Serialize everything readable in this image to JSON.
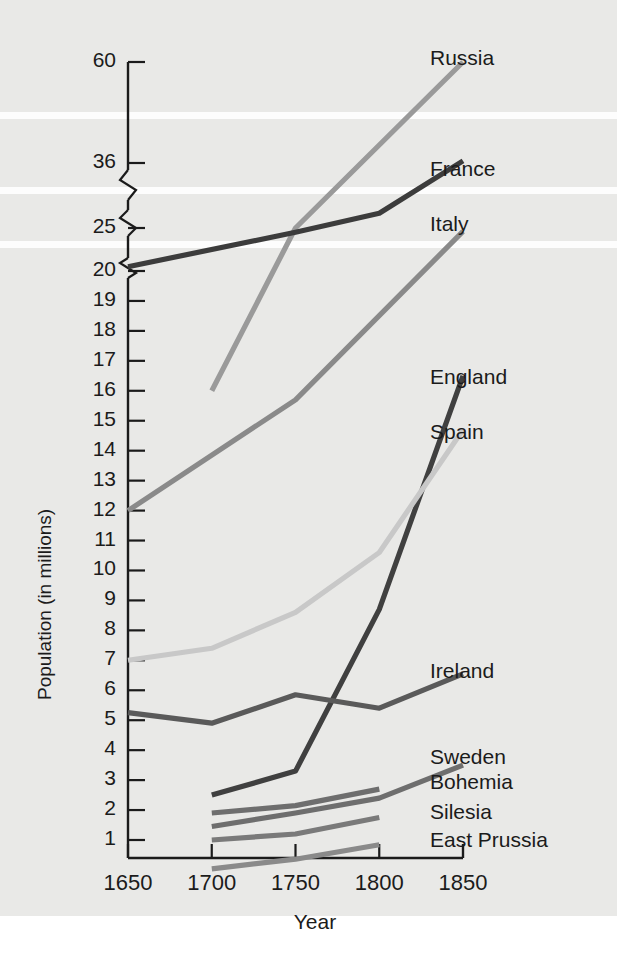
{
  "chart_data": {
    "type": "line",
    "title": "",
    "xlabel": "Year",
    "ylabel": "Population (in millions)",
    "x": [
      1650,
      1700,
      1750,
      1800,
      1850
    ],
    "xticks": [
      "1650",
      "1700",
      "1750",
      "1800",
      "1850"
    ],
    "yticks": [
      "60",
      "36",
      "25",
      "20",
      "19",
      "18",
      "17",
      "16",
      "15",
      "14",
      "13",
      "12",
      "11",
      "10",
      "9",
      "8",
      "7",
      "6",
      "5",
      "4",
      "3",
      "2",
      "1"
    ],
    "axis_breaks": [
      {
        "between": "20 and 25"
      },
      {
        "between": "25 and 36"
      },
      {
        "between": "36 and 60"
      }
    ],
    "grid": false,
    "legend_position": "right-inline-labels",
    "series": [
      {
        "name": "Russia",
        "color": "#9a9a9a",
        "x": [
          1700,
          1750,
          1850
        ],
        "values": [
          16.0,
          25.0,
          60.0
        ]
      },
      {
        "name": "France",
        "color": "#3c3c3c",
        "x": [
          1650,
          1750,
          1800,
          1850
        ],
        "values": [
          20.5,
          24.5,
          27.5,
          36.5
        ]
      },
      {
        "name": "Italy",
        "color": "#8a8a8a",
        "x": [
          1650,
          1750,
          1850
        ],
        "values": [
          12.0,
          15.7,
          24.6
        ]
      },
      {
        "name": "England",
        "color": "#404040",
        "x": [
          1700,
          1750,
          1800,
          1850
        ],
        "values": [
          2.5,
          3.3,
          8.7,
          16.5
        ]
      },
      {
        "name": "Spain",
        "color": "#c8c8c8",
        "x": [
          1650,
          1700,
          1750,
          1800,
          1850
        ],
        "values": [
          7.0,
          7.4,
          8.6,
          10.6,
          14.7
        ]
      },
      {
        "name": "Ireland",
        "color": "#5a5a5a",
        "x": [
          1650,
          1700,
          1750,
          1800,
          1850
        ],
        "values": [
          5.25,
          4.9,
          5.85,
          5.4,
          6.55
        ]
      },
      {
        "name": "Sweden",
        "color": "#6e6e6e",
        "x": [
          1700,
          1750,
          1800,
          1850
        ],
        "values": [
          1.45,
          1.9,
          2.4,
          3.5
        ]
      },
      {
        "name": "Bohemia",
        "color": "#6e6e6e",
        "x": [
          1700,
          1750,
          1800
        ],
        "values": [
          1.9,
          2.15,
          2.7
        ]
      },
      {
        "name": "Silesia",
        "color": "#7a7a7a",
        "x": [
          1700,
          1750,
          1800
        ],
        "values": [
          1.0,
          1.2,
          1.75
        ]
      },
      {
        "name": "East Prussia",
        "color": "#8a8a8a",
        "x": [
          1700,
          1750,
          1800
        ],
        "values": [
          0.4,
          0.6,
          0.9
        ]
      }
    ],
    "series_labels": [
      {
        "name": "Russia",
        "top": 46,
        "left": 430
      },
      {
        "name": "France",
        "top": 157,
        "left": 430
      },
      {
        "name": "Italy",
        "top": 212,
        "left": 430
      },
      {
        "name": "England",
        "top": 365,
        "left": 430
      },
      {
        "name": "Spain",
        "top": 420,
        "left": 430
      },
      {
        "name": "Ireland",
        "top": 659,
        "left": 430
      },
      {
        "name": "Sweden",
        "top": 745,
        "left": 430
      },
      {
        "name": "Bohemia",
        "top": 770,
        "left": 430
      },
      {
        "name": "Silesia",
        "top": 800,
        "left": 430
      },
      {
        "name": "East Prussia",
        "top": 828,
        "left": 430
      }
    ],
    "colors": {
      "background": "#e9e9e7",
      "band": "#fdfdfd",
      "axis": "#1b1b1b",
      "text": "#1b1b1b"
    }
  }
}
